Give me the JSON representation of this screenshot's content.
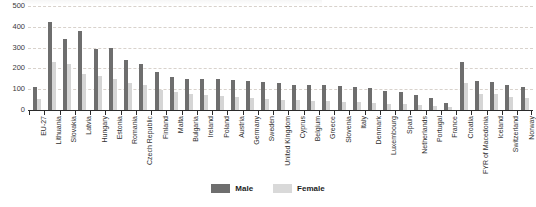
{
  "chart_data": {
    "type": "bar",
    "title": "",
    "xlabel": "",
    "ylabel": "",
    "ylim": [
      0,
      500
    ],
    "yticks": [
      0,
      100,
      200,
      300,
      400,
      500
    ],
    "grid": true,
    "legend_position": "bottom-center",
    "categories": [
      "EU-27",
      "Lithuania",
      "Slovakia",
      "Latvia",
      "Hungary",
      "Estonia",
      "Romania",
      "Czech Republic",
      "Finland",
      "Malta",
      "Bulgaria",
      "Ireland",
      "Poland",
      "Austria",
      "Germany",
      "Sweden",
      "United Kingdom",
      "Cyprus",
      "Belgium",
      "Greece",
      "Slovenia",
      "Italy",
      "Denmark",
      "Luxembourg",
      "Spain",
      "Netherlands",
      "Portugal",
      "France",
      "Croatia",
      "FYR of Macedonia",
      "Iceland",
      "Switzerland",
      "Norway"
    ],
    "series": [
      {
        "name": "Male",
        "color": "#6e6e6e",
        "values": [
          112,
          425,
          340,
          380,
          292,
          298,
          240,
          220,
          182,
          160,
          150,
          150,
          148,
          145,
          138,
          135,
          128,
          122,
          120,
          118,
          115,
          112,
          108,
          92,
          85,
          72,
          60,
          35,
          232,
          140,
          135,
          118,
          112
        ]
      },
      {
        "name": "Female",
        "color": "#d5d5d5",
        "values": [
          55,
          230,
          220,
          175,
          162,
          150,
          128,
          118,
          95,
          85,
          78,
          72,
          68,
          62,
          58,
          55,
          50,
          48,
          45,
          42,
          40,
          38,
          35,
          30,
          28,
          24,
          20,
          14,
          128,
          78,
          75,
          62,
          58
        ]
      }
    ]
  },
  "legend": {
    "items": [
      {
        "label": "Male"
      },
      {
        "label": "Female"
      }
    ]
  }
}
